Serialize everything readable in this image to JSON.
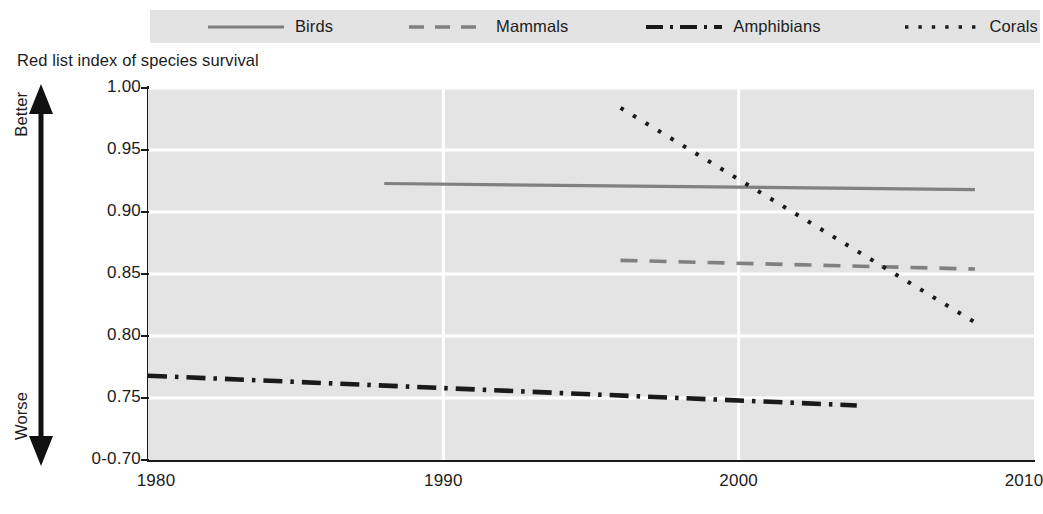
{
  "chart_data": {
    "type": "line",
    "title": "Red list index of species survival",
    "xlabel": "",
    "ylabel": "Red list index of species survival",
    "xlim": [
      1980,
      2010
    ],
    "ylim": [
      0.7,
      1.0
    ],
    "grid": true,
    "legend_position": "top",
    "axis_break_note": "0-0.70",
    "y_ticks": [
      "1.00",
      "0.95",
      "0.90",
      "0.85",
      "0.80",
      "0.75",
      "0-0.70"
    ],
    "y_tick_values": [
      1.0,
      0.95,
      0.9,
      0.85,
      0.8,
      0.75,
      0.7
    ],
    "x_ticks": [
      "1980",
      "1990",
      "2000",
      "2010"
    ],
    "x_tick_values": [
      1980,
      1990,
      2000,
      2010
    ],
    "direction_labels": {
      "top": "Better",
      "bottom": "Worse"
    },
    "series": [
      {
        "name": "Birds",
        "style": "solid",
        "color": "#808080",
        "x": [
          1988,
          2008
        ],
        "values": [
          0.923,
          0.918
        ]
      },
      {
        "name": "Mammals",
        "style": "dashed",
        "color": "#808080",
        "x": [
          1996,
          2008
        ],
        "values": [
          0.861,
          0.854
        ]
      },
      {
        "name": "Amphibians",
        "style": "dashdot",
        "color": "#1a1a1a",
        "x": [
          1980,
          2004
        ],
        "values": [
          0.768,
          0.744
        ]
      },
      {
        "name": "Corals",
        "style": "dotted",
        "color": "#1a1a1a",
        "x": [
          1996,
          2008
        ],
        "values": [
          0.984,
          0.811
        ]
      }
    ]
  },
  "legend": {
    "items": [
      {
        "label": "Birds"
      },
      {
        "label": "Mammals"
      },
      {
        "label": "Amphibians"
      },
      {
        "label": "Corals"
      }
    ]
  },
  "axis": {
    "title": "Red list index of species survival",
    "better_label": "Better",
    "worse_label": "Worse",
    "y_labels": [
      "1.00",
      "0.95",
      "0.90",
      "0.85",
      "0.80",
      "0.75",
      "0-0.70"
    ],
    "x_labels": [
      "1980",
      "1990",
      "2000",
      "2010"
    ]
  },
  "colors": {
    "plot_background": "#e4e4e4",
    "legend_background": "#e3e3e3",
    "gridline": "#ffffff",
    "axis": "#1a1a1a",
    "gray_series": "#808080",
    "black_series": "#1a1a1a"
  }
}
